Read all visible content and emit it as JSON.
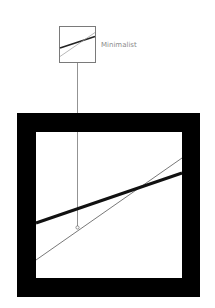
{
  "diagram": {
    "title": "Minimalist",
    "thumbnail": {
      "x": 59,
      "y": 26,
      "w": 37,
      "h": 37,
      "border_color": "#7a7a7a",
      "thick_line": {
        "x1": 59,
        "y1": 48,
        "x2": 96,
        "y2": 36
      },
      "thin_line": {
        "x1": 59,
        "y1": 57,
        "x2": 96,
        "y2": 32
      }
    },
    "connector": {
      "x": 77,
      "y1": 63,
      "y2": 227,
      "end_circle_r": 1.6
    },
    "frame": {
      "outer": {
        "x": 17,
        "y": 113,
        "w": 183,
        "h": 184
      },
      "inner": {
        "x": 36,
        "y": 132,
        "w": 146,
        "h": 146
      },
      "color": "#000000"
    },
    "lines": {
      "thick": {
        "x1": 36,
        "y1": 223,
        "x2": 182,
        "y2": 173,
        "width": 3
      },
      "thin": {
        "x1": 36,
        "y1": 260,
        "x2": 182,
        "y2": 158,
        "width": 0.8
      }
    },
    "colors": {
      "line": "#111111",
      "thin_line": "#555555",
      "label": "#8a8a8a"
    }
  }
}
